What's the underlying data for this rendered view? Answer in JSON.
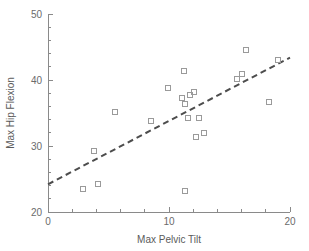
{
  "chart_data": {
    "type": "scatter",
    "title": "",
    "xlabel": "Max Pelvic Tilt",
    "ylabel": "Max Hip Flexion",
    "xlim": [
      0,
      20
    ],
    "ylim": [
      20,
      50
    ],
    "xticks": [
      0,
      10,
      20
    ],
    "yticks": [
      20,
      30,
      40,
      50
    ],
    "xtick_labels": [
      "0",
      "10",
      "20"
    ],
    "ytick_labels": [
      "20",
      "30",
      "40",
      "50"
    ],
    "x_minor_tick_step": 2,
    "y_minor_tick_step": 2,
    "grid": false,
    "legend": false,
    "marker": "open-square",
    "marker_color": "#9a9a9a",
    "points": [
      {
        "x": 2.9,
        "y": 23.5
      },
      {
        "x": 3.8,
        "y": 29.2
      },
      {
        "x": 4.1,
        "y": 24.2
      },
      {
        "x": 5.5,
        "y": 35.2
      },
      {
        "x": 8.5,
        "y": 33.8
      },
      {
        "x": 9.9,
        "y": 38.8
      },
      {
        "x": 11.2,
        "y": 41.4
      },
      {
        "x": 11.1,
        "y": 37.2
      },
      {
        "x": 11.3,
        "y": 36.4
      },
      {
        "x": 11.7,
        "y": 37.7
      },
      {
        "x": 12.1,
        "y": 38.2
      },
      {
        "x": 11.6,
        "y": 34.3
      },
      {
        "x": 12.5,
        "y": 34.2
      },
      {
        "x": 12.2,
        "y": 31.4
      },
      {
        "x": 12.9,
        "y": 32.0
      },
      {
        "x": 11.3,
        "y": 23.2
      },
      {
        "x": 15.6,
        "y": 40.1
      },
      {
        "x": 16.0,
        "y": 40.9
      },
      {
        "x": 16.4,
        "y": 44.5
      },
      {
        "x": 18.3,
        "y": 36.6
      },
      {
        "x": 19.0,
        "y": 43.0
      }
    ],
    "trend_line": {
      "style": "dashed",
      "color": "#4d4d4d",
      "x_start": 0,
      "y_start": 24.2,
      "x_end": 20,
      "y_end": 43.4
    }
  }
}
